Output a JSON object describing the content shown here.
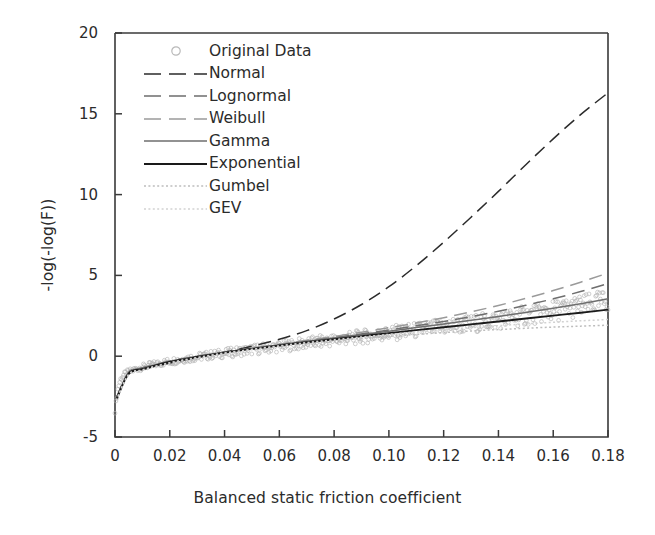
{
  "chart_data": {
    "type": "line",
    "title": "",
    "xlabel": "Balanced static friction coefficient",
    "ylabel": "-log(-log(F))",
    "xlim": [
      0,
      0.18
    ],
    "ylim": [
      -5,
      20
    ],
    "xticks": [
      "0",
      "0.02",
      "0.04",
      "0.06",
      "0.08",
      "0.10",
      "0.12",
      "0.14",
      "0.16",
      "0.18"
    ],
    "xtick_values": [
      0,
      0.02,
      0.04,
      0.06,
      0.08,
      0.1,
      0.12,
      0.14,
      0.16,
      0.18
    ],
    "yticks": [
      "-5",
      "0",
      "5",
      "10",
      "15",
      "20"
    ],
    "ytick_values": [
      -5,
      0,
      5,
      10,
      15,
      20
    ],
    "grid": false,
    "legend_position": "upper left (inside axes)",
    "legend": [
      {
        "label": "Original Data",
        "style": "marker",
        "marker": "circle-open",
        "color": "#b9b9b9"
      },
      {
        "label": "Normal",
        "style": "dashed",
        "color": "#2b2b2b",
        "dash": "14 7"
      },
      {
        "label": "Lognormal",
        "style": "dashed",
        "color": "#6e6e6e",
        "dash": "14 7"
      },
      {
        "label": "Weibull",
        "style": "dashed",
        "color": "#9a9a9a",
        "dash": "14 7"
      },
      {
        "label": "Gamma",
        "style": "solid",
        "color": "#6e6e6e"
      },
      {
        "label": "Exponential",
        "style": "solid",
        "color": "#1a1a1a"
      },
      {
        "label": "Gumbel",
        "style": "dotted",
        "color": "#bdbdbd"
      },
      {
        "label": "GEV",
        "style": "dotted",
        "color": "#d2d2d2"
      }
    ],
    "series": [
      {
        "name": "Original Data",
        "kind": "scatter",
        "color": "#b0b0b0",
        "x": [
          0.0005,
          0.0008,
          0.0012,
          0.002,
          0.003,
          0.004,
          0.006,
          0.008,
          0.01,
          0.013,
          0.016,
          0.02,
          0.025,
          0.03,
          0.035,
          0.04,
          0.045,
          0.05,
          0.055,
          0.06,
          0.065,
          0.07,
          0.075,
          0.08,
          0.085,
          0.09,
          0.095,
          0.1,
          0.105,
          0.11,
          0.115,
          0.12,
          0.125,
          0.13,
          0.135,
          0.14,
          0.145,
          0.15,
          0.155,
          0.16,
          0.165,
          0.17,
          0.175,
          0.18
        ],
        "y": [
          -2.7,
          -2.3,
          -1.9,
          -1.45,
          -1.2,
          -1.05,
          -0.9,
          -0.78,
          -0.68,
          -0.55,
          -0.45,
          -0.32,
          -0.18,
          -0.05,
          0.07,
          0.18,
          0.29,
          0.4,
          0.5,
          0.6,
          0.7,
          0.8,
          0.9,
          1.0,
          1.1,
          1.2,
          1.3,
          1.4,
          1.5,
          1.6,
          1.7,
          1.8,
          1.9,
          2.0,
          2.12,
          2.25,
          2.38,
          2.52,
          2.66,
          2.8,
          2.95,
          3.1,
          3.25,
          3.45
        ]
      },
      {
        "name": "Normal",
        "kind": "line",
        "color": "#2b2b2b",
        "x": [
          0.0005,
          0.005,
          0.01,
          0.02,
          0.03,
          0.04,
          0.05,
          0.06,
          0.07,
          0.08,
          0.09,
          0.1,
          0.11,
          0.12,
          0.13,
          0.14,
          0.15,
          0.16,
          0.17,
          0.18
        ],
        "y": [
          -2.55,
          -1.1,
          -0.82,
          -0.42,
          -0.08,
          0.25,
          0.62,
          1.05,
          1.58,
          2.3,
          3.2,
          4.3,
          5.6,
          7.05,
          8.6,
          10.2,
          11.85,
          13.45,
          14.95,
          16.3
        ]
      },
      {
        "name": "Lognormal",
        "kind": "line",
        "color": "#6e6e6e",
        "x": [
          0.0005,
          0.005,
          0.01,
          0.02,
          0.03,
          0.04,
          0.05,
          0.06,
          0.07,
          0.08,
          0.09,
          0.1,
          0.11,
          0.12,
          0.13,
          0.14,
          0.15,
          0.16,
          0.17,
          0.18
        ],
        "y": [
          -2.6,
          -1.0,
          -0.72,
          -0.3,
          0.0,
          0.25,
          0.48,
          0.7,
          0.92,
          1.15,
          1.38,
          1.62,
          1.88,
          2.15,
          2.45,
          2.78,
          3.15,
          3.55,
          4.0,
          4.5
        ]
      },
      {
        "name": "Weibull",
        "kind": "line",
        "color": "#9a9a9a",
        "x": [
          0.0005,
          0.005,
          0.01,
          0.02,
          0.03,
          0.04,
          0.05,
          0.06,
          0.07,
          0.08,
          0.09,
          0.1,
          0.11,
          0.12,
          0.13,
          0.14,
          0.15,
          0.16,
          0.17,
          0.18
        ],
        "y": [
          -2.65,
          -1.05,
          -0.75,
          -0.33,
          -0.02,
          0.25,
          0.5,
          0.74,
          0.98,
          1.22,
          1.48,
          1.76,
          2.06,
          2.38,
          2.74,
          3.14,
          3.58,
          4.06,
          4.58,
          5.15
        ]
      },
      {
        "name": "Gamma",
        "kind": "line",
        "color": "#6e6e6e",
        "x": [
          0.0005,
          0.005,
          0.01,
          0.02,
          0.03,
          0.04,
          0.05,
          0.06,
          0.07,
          0.08,
          0.09,
          0.1,
          0.11,
          0.12,
          0.13,
          0.14,
          0.15,
          0.16,
          0.17,
          0.18
        ],
        "y": [
          -2.62,
          -1.02,
          -0.74,
          -0.32,
          -0.02,
          0.24,
          0.48,
          0.7,
          0.92,
          1.13,
          1.34,
          1.55,
          1.77,
          1.99,
          2.22,
          2.46,
          2.71,
          2.97,
          3.25,
          3.55
        ]
      },
      {
        "name": "Exponential",
        "kind": "line",
        "color": "#1a1a1a",
        "x": [
          0.0005,
          0.005,
          0.01,
          0.02,
          0.03,
          0.04,
          0.05,
          0.06,
          0.07,
          0.08,
          0.09,
          0.1,
          0.11,
          0.12,
          0.13,
          0.14,
          0.15,
          0.16,
          0.17,
          0.18
        ],
        "y": [
          -2.68,
          -1.08,
          -0.8,
          -0.36,
          -0.05,
          0.22,
          0.45,
          0.66,
          0.86,
          1.05,
          1.24,
          1.43,
          1.61,
          1.79,
          1.97,
          2.15,
          2.33,
          2.51,
          2.69,
          2.88
        ]
      },
      {
        "name": "Gumbel",
        "kind": "line",
        "color": "#bdbdbd",
        "x": [
          0.0005,
          0.005,
          0.01,
          0.02,
          0.03,
          0.04,
          0.05,
          0.06,
          0.07,
          0.08,
          0.09,
          0.1,
          0.11,
          0.12,
          0.13,
          0.14,
          0.15,
          0.16,
          0.17,
          0.18
        ],
        "y": [
          -2.72,
          -1.12,
          -0.84,
          -0.4,
          -0.08,
          0.2,
          0.42,
          0.62,
          0.8,
          0.96,
          1.1,
          1.23,
          1.35,
          1.46,
          1.56,
          1.65,
          1.73,
          1.8,
          1.86,
          1.92
        ]
      },
      {
        "name": "GEV",
        "kind": "line",
        "color": "#d2d2d2",
        "x": [
          0.0005,
          0.005,
          0.01,
          0.02,
          0.03,
          0.04,
          0.05,
          0.06,
          0.07,
          0.08,
          0.09,
          0.1,
          0.11,
          0.12,
          0.13,
          0.14,
          0.15,
          0.16,
          0.17,
          0.18
        ],
        "y": [
          -2.75,
          -1.15,
          -0.86,
          -0.42,
          -0.1,
          0.18,
          0.42,
          0.64,
          0.84,
          1.02,
          1.19,
          1.35,
          1.5,
          1.64,
          1.77,
          1.89,
          2.0,
          2.1,
          2.19,
          2.27
        ]
      }
    ]
  }
}
